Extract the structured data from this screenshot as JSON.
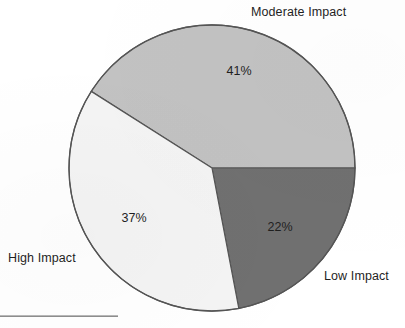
{
  "chart_data": {
    "type": "pie",
    "title": "",
    "subtitle": "",
    "xlabel": "",
    "ylabel": "",
    "legend_position": "none",
    "grid": false,
    "labels_outside": true,
    "start_angle_deg": 0,
    "direction": "counterclockwise",
    "categories": [
      "Moderate Impact",
      "Low Impact",
      "High Impact"
    ],
    "values": [
      41,
      22,
      37
    ],
    "value_suffix": "%",
    "slices": [
      {
        "name": "Moderate Impact",
        "value": 41,
        "value_label": "41%",
        "color": "#c2c2c2",
        "label_position": "top-right"
      },
      {
        "name": "Low Impact",
        "value": 22,
        "value_label": "22%",
        "color": "#707070",
        "label_position": "bottom-right"
      },
      {
        "name": "High Impact",
        "value": 37,
        "value_label": "37%",
        "color": "#f4f4f4",
        "label_position": "left"
      }
    ]
  },
  "figure": {
    "background_color": "#ffffff",
    "outline_color": "#555555",
    "text_color": "#1f1f1f",
    "center": {
      "x": 212,
      "y": 168
    },
    "radius": 143
  },
  "annotations": {
    "bottom_rule_present": true
  }
}
